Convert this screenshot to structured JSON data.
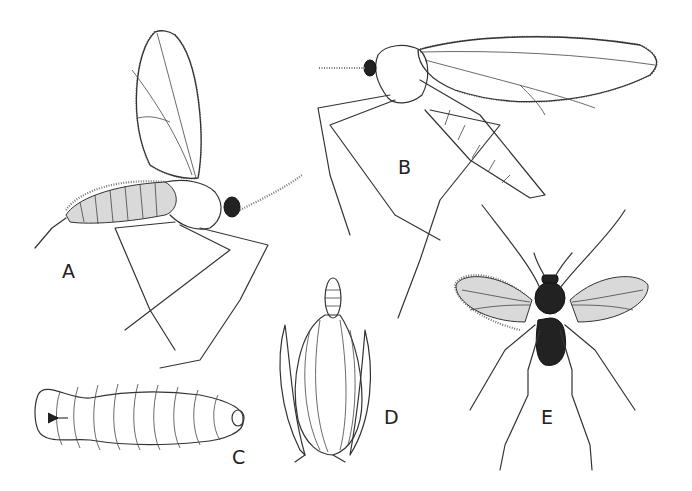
{
  "plate": {
    "figures": [
      {
        "id": "A",
        "label": "A",
        "subject": "adult midge, lateral view, wings raised"
      },
      {
        "id": "B",
        "label": "B",
        "subject": "adult midge, lateral view, wing extended"
      },
      {
        "id": "C",
        "label": "C",
        "subject": "larva, ventral view with breastbone"
      },
      {
        "id": "D",
        "label": "D",
        "subject": "grass floret with emerging pupa"
      },
      {
        "id": "E",
        "label": "E",
        "subject": "adult midge, dorsal view, wings spread"
      }
    ]
  },
  "colors": {
    "background": "#ffffff",
    "ink": "#333333"
  }
}
